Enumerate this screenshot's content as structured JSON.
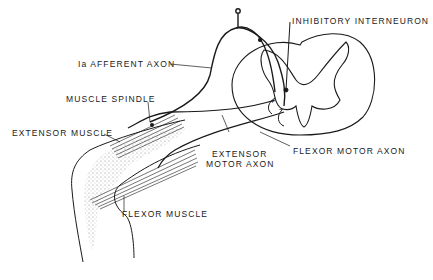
{
  "diagram": {
    "type": "anatomical-line-drawing",
    "labels": {
      "inhibitory_interneuron": "INHIBITORY INTERNEURON",
      "ia_afferent_axon": "Ia AFFERENT AXON",
      "muscle_spindle": "MUSCLE SPINDLE",
      "extensor_muscle": "EXTENSOR MUSCLE",
      "extensor_motor_axon_line1": "EXTENSOR",
      "extensor_motor_axon_line2": "MOTOR AXON",
      "flexor_motor_axon": "FLEXOR MOTOR AXON",
      "flexor_muscle": "FLEXOR MUSCLE"
    },
    "synapse_signs": {
      "excitatory": "+",
      "inhibitory": "−"
    },
    "colors": {
      "ink": "#1a1a1a",
      "stipple": "#9a9a9a",
      "background": "#ffffff"
    }
  }
}
